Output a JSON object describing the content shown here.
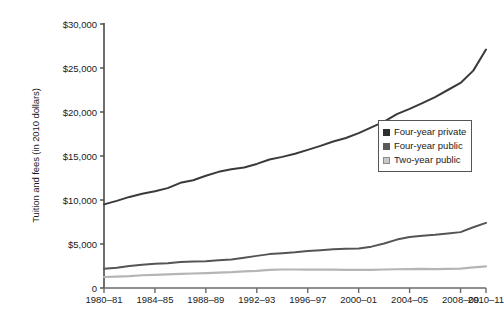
{
  "chart_data": {
    "type": "line",
    "title": "",
    "xlabel": "",
    "ylabel": "Tuition and fees (in 2010 dollars)",
    "grid": false,
    "legend_position": "right-middle",
    "ylim": [
      0,
      30000
    ],
    "yticks": [
      0,
      5000,
      10000,
      15000,
      20000,
      25000,
      30000
    ],
    "ytick_labels": [
      "0",
      "$5,000",
      "$10,000",
      "$15,000",
      "$20,000",
      "$25,000",
      "$30,000"
    ],
    "categories": [
      "1980–81",
      "1981–82",
      "1982–83",
      "1983–84",
      "1984–85",
      "1985–86",
      "1986–87",
      "1987–88",
      "1988–89",
      "1989–90",
      "1990–91",
      "1991–92",
      "1992–93",
      "1993–94",
      "1994–95",
      "1995–96",
      "1996–97",
      "1997–98",
      "1998–99",
      "1999–2000",
      "2000–01",
      "2001–02",
      "2002–03",
      "2003–04",
      "2004–05",
      "2005–06",
      "2006–07",
      "2007–08",
      "2008–09",
      "2009–10",
      "2010–11"
    ],
    "xtick_labels": [
      "1980–81",
      "1984–85",
      "1988–89",
      "1992–93",
      "1996–97",
      "2000–01",
      "2004–05",
      "2008–09",
      "2010–11"
    ],
    "xtick_indices": [
      0,
      4,
      8,
      12,
      16,
      20,
      24,
      28,
      30
    ],
    "series": [
      {
        "name": "Four-year private",
        "color": "#3a3a3a",
        "values": [
          9500,
          9900,
          10350,
          10700,
          11000,
          11350,
          11950,
          12250,
          12750,
          13200,
          13500,
          13700,
          14100,
          14600,
          14900,
          15250,
          15700,
          16150,
          16650,
          17050,
          17600,
          18250,
          18900,
          19750,
          20350,
          21000,
          21700,
          22500,
          23300,
          24700,
          27100
        ]
      },
      {
        "name": "Four-year public",
        "color": "#555555",
        "values": [
          2200,
          2300,
          2500,
          2650,
          2750,
          2800,
          2950,
          3000,
          3050,
          3150,
          3250,
          3450,
          3650,
          3850,
          3950,
          4050,
          4200,
          4300,
          4400,
          4450,
          4500,
          4700,
          5050,
          5500,
          5800,
          5950,
          6050,
          6200,
          6350,
          6900,
          7400
        ]
      },
      {
        "name": "Two-year public",
        "color": "#b5b5b5",
        "values": [
          1250,
          1300,
          1350,
          1450,
          1500,
          1550,
          1600,
          1650,
          1700,
          1750,
          1800,
          1900,
          1950,
          2050,
          2100,
          2100,
          2080,
          2100,
          2080,
          2060,
          2050,
          2070,
          2100,
          2130,
          2150,
          2180,
          2150,
          2180,
          2200,
          2350,
          2450
        ]
      }
    ]
  },
  "legend": {
    "items": [
      {
        "label": "Four-year private",
        "color": "#2e2e2e"
      },
      {
        "label": "Four-year public",
        "color": "#5a5a5a"
      },
      {
        "label": "Two-year public",
        "color": "#c8c8c8"
      }
    ]
  }
}
